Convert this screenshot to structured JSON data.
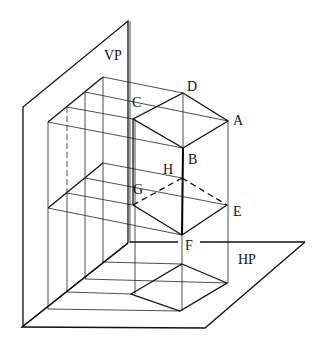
{
  "diagram": {
    "type": "orthographic projection pictorial",
    "planes": {
      "vertical": "VP",
      "horizontal": "HP"
    },
    "vertices": {
      "A": "A",
      "B": "B",
      "C": "C",
      "D": "D",
      "E": "E",
      "F": "F",
      "G": "G",
      "H": "H"
    },
    "colors": {
      "line": "#111111",
      "background": "#ffffff"
    }
  }
}
